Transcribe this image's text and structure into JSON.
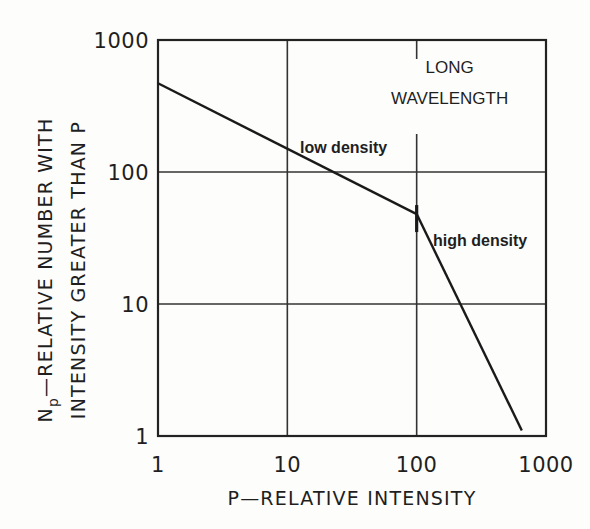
{
  "chart_data": {
    "type": "line",
    "title": "",
    "xlabel": "P—RELATIVE INTENSITY",
    "ylabel_line1": "Nₚ—RELATIVE NUMBER WITH",
    "ylabel_line2": "INTENSITY GREATER THAN P",
    "ylabel_main": "N",
    "ylabel_sub": "p",
    "ylabel_rest": "—RELATIVE NUMBER WITH",
    "xscale": "log",
    "yscale": "log",
    "xlim": [
      1,
      1000
    ],
    "ylim": [
      1,
      1000
    ],
    "grid": true,
    "x_ticks": [
      1,
      10,
      100,
      1000
    ],
    "x_tick_labels": [
      "1",
      "10",
      "100",
      "1000"
    ],
    "y_ticks": [
      1,
      10,
      100,
      1000
    ],
    "y_tick_labels": [
      "1",
      "10",
      "100",
      "1000"
    ],
    "series": [
      {
        "name": "low density",
        "x": [
          1,
          100
        ],
        "y": [
          470,
          48
        ],
        "log_slope": -0.5
      },
      {
        "name": "high density",
        "x": [
          100,
          650
        ],
        "y": [
          48,
          1.1
        ],
        "log_slope": -2.0
      }
    ],
    "breakpoint": {
      "x": 100,
      "y": 48
    },
    "annotations": [
      {
        "text": "LONG",
        "x": 180,
        "y": 560
      },
      {
        "text": "WAVELENGTH",
        "x": 180,
        "y": 330
      },
      {
        "text": "low density",
        "x": 11,
        "y": 150
      },
      {
        "text": "high density",
        "x": 110,
        "y": 38
      }
    ]
  }
}
